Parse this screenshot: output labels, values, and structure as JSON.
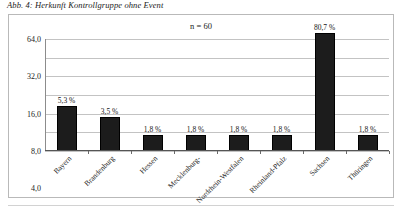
{
  "figure": {
    "caption": "Abb. 4: Herkunft Kontrollgruppe ohne Event"
  },
  "chart_data": {
    "type": "bar",
    "title": "Abb. 4: Herkunft Kontrollgruppe ohne Event",
    "annotation": "n = 60",
    "xlabel": "",
    "ylabel": "",
    "yscale": "log",
    "ylim": [
      1.0,
      64.0
    ],
    "grid": true,
    "legend": null,
    "ytick_labels": [
      "64,0",
      "32,0",
      "16,0",
      "8,0",
      "4,0",
      "2,0",
      "1,0"
    ],
    "ytick_values": [
      64.0,
      32.0,
      16.0,
      8.0,
      4.0,
      2.0,
      1.0
    ],
    "categories": [
      "Bayern",
      "Brandenburg",
      "Hessen",
      "Mecklenburg-",
      "Nordrhein-Westfalen",
      "Rheinland-Pfalz",
      "Sachsen",
      "Thüringen"
    ],
    "values": [
      5.3,
      3.5,
      1.8,
      1.8,
      1.8,
      1.8,
      80.7,
      1.8
    ],
    "data_labels": [
      "5,3 %",
      "3,5 %",
      "1,8 %",
      "1,8 %",
      "1,8 %",
      "1,8 %",
      "80,7 %",
      "1,8 %"
    ],
    "colors": {
      "bar": "#1c1c1c",
      "grid": "#c3c3c3",
      "axis": "#555555",
      "frame": "#b9b9b9",
      "text": "#1b1b1b",
      "background": "#ffffff"
    }
  }
}
